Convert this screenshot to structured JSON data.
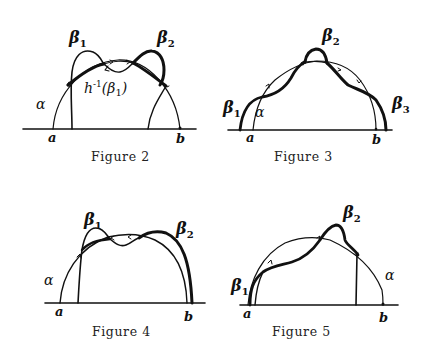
{
  "figures": [
    {
      "id": "figure-2",
      "caption": "Figure 2",
      "labels": {
        "alpha": "α",
        "beta1": "β",
        "beta1_sub": "1",
        "beta2": "β",
        "beta2_sub": "2",
        "a": "a",
        "b": "b",
        "preimage": "h",
        "preimage_sup": "-1",
        "preimage_arg": "(β",
        "preimage_arg_sub": "1",
        "preimage_close": ")"
      }
    },
    {
      "id": "figure-3",
      "caption": "Figure 3",
      "labels": {
        "alpha": "α",
        "beta1": "β",
        "beta1_sub": "1",
        "beta2": "β",
        "beta2_sub": "2",
        "beta3": "β",
        "beta3_sub": "3",
        "a": "a",
        "b": "b"
      }
    },
    {
      "id": "figure-4",
      "caption": "Figure 4",
      "labels": {
        "alpha": "α",
        "beta1": "β",
        "beta1_sub": "1",
        "beta2": "β",
        "beta2_sub": "2",
        "a": "a",
        "b": "b"
      }
    },
    {
      "id": "figure-5",
      "caption": "Figure 5",
      "labels": {
        "alpha": "α",
        "beta1": "β",
        "beta1_sub": "1",
        "beta2": "β",
        "beta2_sub": "2",
        "a": "a",
        "b": "b"
      }
    }
  ],
  "colors": {
    "ink": "#111111",
    "background": "#ffffff"
  }
}
